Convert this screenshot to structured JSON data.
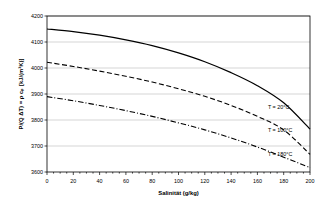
{
  "chart_data": {
    "type": "line",
    "title": "",
    "xlabel": "Salinität (g/kg)",
    "ylabel": "P/(Q ΔT) = ρ cₚ  [kJ/(m³K)]",
    "xlim": [
      0,
      200
    ],
    "ylim": [
      3600,
      4200
    ],
    "xticks": [
      0,
      20,
      40,
      60,
      80,
      100,
      120,
      140,
      160,
      180,
      200
    ],
    "xtick_labels": [
      "0",
      "20",
      "40",
      "60",
      "80",
      "100",
      "120",
      "140",
      "160",
      "180",
      "200"
    ],
    "yticks": [
      3600,
      3700,
      3800,
      3900,
      4000,
      4100,
      4200
    ],
    "ytick_labels": [
      "3600",
      "3700",
      "3800",
      "3900",
      "4000",
      "4100",
      "4200"
    ],
    "grid": "horizontal",
    "legend_position": "inline-right",
    "x": [
      0,
      20,
      40,
      60,
      80,
      100,
      120,
      140,
      160,
      180,
      200
    ],
    "series": [
      {
        "name": "T = 20°C",
        "style": "solid",
        "color": "#000000",
        "label_x": 168,
        "label_y": 3842,
        "values": [
          4150,
          4140,
          4126,
          4108,
          4086,
          4058,
          4024,
          3982,
          3932,
          3866,
          3765
        ]
      },
      {
        "name": "T = 100°C",
        "style": "dashed",
        "color": "#000000",
        "label_x": 168,
        "label_y": 3755,
        "values": [
          4022,
          4006,
          3988,
          3968,
          3946,
          3920,
          3891,
          3856,
          3814,
          3762,
          3668
        ]
      },
      {
        "name": "T = 180°C",
        "style": "dashdot",
        "color": "#000000",
        "label_x": 168,
        "label_y": 3660,
        "values": [
          3890,
          3874,
          3856,
          3836,
          3814,
          3789,
          3762,
          3731,
          3696,
          3657,
          3617
        ]
      }
    ]
  },
  "axes": {
    "xlabel": "Salinität (g/kg)",
    "ylabel": "P/(Q ΔT) = ρ cₚ  [kJ/(m³K)]"
  }
}
